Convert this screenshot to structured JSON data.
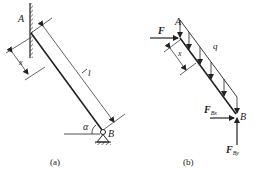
{
  "panel_a": {
    "caption": "(a)",
    "labels": {
      "A": "A",
      "B": "B",
      "length": "l",
      "x": "x",
      "angle": "α"
    }
  },
  "panel_b": {
    "caption": "(b)",
    "labels": {
      "A": "A",
      "B": "B",
      "F": "F",
      "q": "q",
      "x": "x",
      "FBx_main": "F",
      "FBx_sub": "Bx",
      "FBy_main": "F",
      "FBy_sub": "By"
    }
  },
  "colors": {
    "line": "#222222",
    "background": "#ffffff"
  }
}
